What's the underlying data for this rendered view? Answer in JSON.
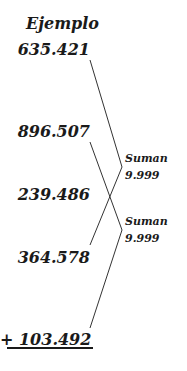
{
  "title": "Ejemplo",
  "numbers": [
    "635.421",
    "896.507",
    "239.486",
    "364.578",
    "+  103.492"
  ],
  "pairs": [
    {
      "label": "Suman",
      "value": "9.999"
    },
    {
      "label": "Suman",
      "value": "9.999"
    }
  ],
  "colors": {
    "text": "#1a1a1a",
    "line": "#333333"
  }
}
